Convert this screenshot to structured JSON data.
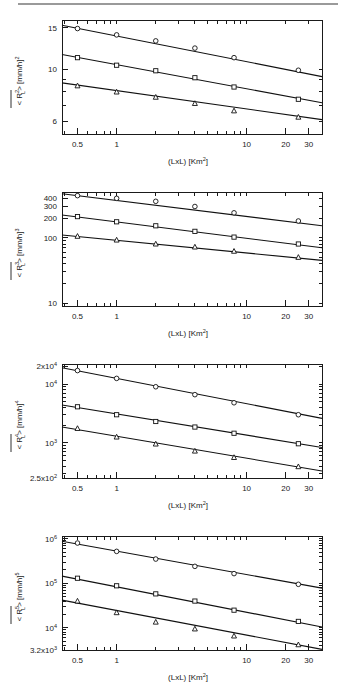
{
  "figure": {
    "name": "rainfall-moment-scaling-figure",
    "panel_count": 4,
    "background": "#ffffff",
    "line_color": "#111111",
    "marker_fill": "#ffffff"
  },
  "chart_data": [
    {
      "type": "scatter",
      "panel_id": "panel-1",
      "title": "",
      "xlabel_parts": {
        "main": "(LxL)  [Km",
        "sup": "2",
        "tail": "]"
      },
      "xlabel": "(LxL) [Km2]",
      "ylabel_parts": {
        "pre": "< R",
        "sup": "2",
        "sub": "L",
        "post": "> [mm/h]",
        "post_sup": "2"
      },
      "ylabel": "<R2L> [mm/h]2",
      "xscale": "log",
      "yscale": "log",
      "xlim": [
        0.38,
        38
      ],
      "ylim": [
        5.3,
        16.2
      ],
      "grid": false,
      "legend": "none",
      "xticks": [
        {
          "value": 0.5,
          "label": "0.5"
        },
        {
          "value": 1,
          "label": "1"
        },
        {
          "value": 10,
          "label": "10"
        },
        {
          "value": 20,
          "label": "20"
        },
        {
          "value": 30,
          "label": "30"
        }
      ],
      "yticks": [
        {
          "value": 15,
          "label": "15"
        },
        {
          "value": 10,
          "label": "10"
        },
        {
          "value": 6,
          "label": "6"
        }
      ],
      "x": [
        0.5,
        1,
        2,
        4,
        8,
        25
      ],
      "series": [
        {
          "name": "series-circle",
          "marker": "circle",
          "values": [
            14.9,
            14.0,
            13.2,
            12.3,
            11.2,
            9.9
          ],
          "fit_endpoints": {
            "x": [
              0.38,
              38
            ],
            "y": [
              15.4,
              9.3
            ]
          }
        },
        {
          "name": "series-square",
          "marker": "square",
          "values": [
            11.2,
            10.4,
            9.85,
            9.2,
            8.4,
            7.45
          ],
          "fit_endpoints": {
            "x": [
              0.38,
              38
            ],
            "y": [
              11.55,
              7.2
            ]
          }
        },
        {
          "name": "series-triangle",
          "marker": "triangle",
          "values": [
            8.5,
            8.0,
            7.6,
            7.15,
            6.65,
            6.25
          ],
          "fit_endpoints": {
            "x": [
              0.38,
              38
            ],
            "y": [
              8.75,
              6.1
            ]
          }
        }
      ]
    },
    {
      "type": "scatter",
      "panel_id": "panel-2",
      "title": "",
      "xlabel_parts": {
        "main": "(LxL)  [Km",
        "sup": "2",
        "tail": "]"
      },
      "xlabel": "(LxL) [Km2]",
      "ylabel_parts": {
        "pre": "< R",
        "sup": "3",
        "sub": "L",
        "post": "> [mm/h]",
        "post_sup": "3"
      },
      "ylabel": "<R3L> [mm/h]3",
      "xscale": "log",
      "yscale": "log",
      "xlim": [
        0.38,
        38
      ],
      "ylim": [
        9,
        500
      ],
      "grid": false,
      "legend": "none",
      "xticks": [
        {
          "value": 0.5,
          "label": "0.5"
        },
        {
          "value": 1,
          "label": "1"
        },
        {
          "value": 10,
          "label": "10"
        },
        {
          "value": 20,
          "label": "20"
        },
        {
          "value": 30,
          "label": "30"
        }
      ],
      "yticks": [
        {
          "value": 400,
          "label": "400"
        },
        {
          "value": 300,
          "label": "300"
        },
        {
          "value": 200,
          "label": "200"
        },
        {
          "value": 100,
          "label": "100"
        },
        {
          "value": 10,
          "label": "10"
        }
      ],
      "x": [
        0.5,
        1,
        2,
        4,
        8,
        25
      ],
      "series": [
        {
          "name": "series-circle",
          "marker": "circle",
          "values": [
            440,
            400,
            360,
            300,
            240,
            180
          ],
          "fit_endpoints": {
            "x": [
              0.38,
              38
            ],
            "y": [
              470,
              152
            ]
          }
        },
        {
          "name": "series-square",
          "marker": "square",
          "values": [
            210,
            175,
            152,
            125,
            102,
            80
          ],
          "fit_endpoints": {
            "x": [
              0.38,
              38
            ],
            "y": [
              222,
              70
            ]
          }
        },
        {
          "name": "series-triangle",
          "marker": "triangle",
          "values": [
            105,
            92,
            80,
            72,
            62,
            50
          ],
          "fit_endpoints": {
            "x": [
              0.38,
              38
            ],
            "y": [
              110,
              45
            ]
          }
        }
      ]
    },
    {
      "type": "scatter",
      "panel_id": "panel-3",
      "title": "",
      "xlabel_parts": {
        "main": "(LxL)  [Km",
        "sup": "2",
        "tail": "]"
      },
      "xlabel": "(LxL) [Km2]",
      "ylabel_parts": {
        "pre": "< R",
        "sup": "4",
        "sub": "L",
        "post": "> [mm/h]",
        "post_sup": "4"
      },
      "ylabel": "<R4L> [mm/h]4",
      "xscale": "log",
      "yscale": "log",
      "xlim": [
        0.38,
        38
      ],
      "ylim": [
        250,
        22000
      ],
      "grid": false,
      "legend": "none",
      "xticks": [
        {
          "value": 0.5,
          "label": "0.5"
        },
        {
          "value": 1,
          "label": "1"
        },
        {
          "value": 10,
          "label": "10"
        },
        {
          "value": 20,
          "label": "20"
        },
        {
          "value": 30,
          "label": "30"
        }
      ],
      "yticks": [
        {
          "value": 20000,
          "base": "2x10",
          "exp": "4",
          "label": "2x10^4"
        },
        {
          "value": 10000,
          "base": "10",
          "exp": "4",
          "label": "10^4"
        },
        {
          "value": 1000,
          "base": "10",
          "exp": "3",
          "label": "10^3"
        },
        {
          "value": 250,
          "base": "2.5x10",
          "exp": "2",
          "label": "2.5x10^2"
        }
      ],
      "x": [
        0.5,
        1,
        2,
        4,
        8,
        25
      ],
      "series": [
        {
          "name": "series-circle",
          "marker": "circle",
          "values": [
            17000,
            12500,
            9000,
            6600,
            4800,
            3000
          ],
          "fit_endpoints": {
            "x": [
              0.38,
              38
            ],
            "y": [
              19000,
              2600
            ]
          }
        },
        {
          "name": "series-square",
          "marker": "square",
          "values": [
            4100,
            3000,
            2300,
            1850,
            1450,
            960
          ],
          "fit_endpoints": {
            "x": [
              0.38,
              38
            ],
            "y": [
              4400,
              830
            ]
          }
        },
        {
          "name": "series-triangle",
          "marker": "triangle",
          "values": [
            1750,
            1250,
            950,
            720,
            560,
            390
          ],
          "fit_endpoints": {
            "x": [
              0.38,
              38
            ],
            "y": [
              1850,
              330
            ]
          }
        }
      ]
    },
    {
      "type": "scatter",
      "panel_id": "panel-4",
      "title": "",
      "xlabel_parts": {
        "main": "(LxL)  [Km",
        "sup": "2",
        "tail": "]"
      },
      "xlabel": "(LxL) [Km2]",
      "ylabel_parts": {
        "pre": "< R",
        "sup": "5",
        "sub": "L",
        "post": "> [mm/h]",
        "post_sup": "5"
      },
      "ylabel": "<R5L> [mm/h]5",
      "xscale": "log",
      "yscale": "log",
      "xlim": [
        0.38,
        38
      ],
      "ylim": [
        3200,
        1150000
      ],
      "grid": false,
      "legend": "none",
      "xticks": [
        {
          "value": 0.5,
          "label": "0.5"
        },
        {
          "value": 1,
          "label": "1"
        },
        {
          "value": 10,
          "label": "10"
        },
        {
          "value": 20,
          "label": "20"
        },
        {
          "value": 30,
          "label": "30"
        }
      ],
      "yticks": [
        {
          "value": 1000000,
          "base": "10",
          "exp": "6",
          "label": "10^6"
        },
        {
          "value": 100000,
          "base": "10",
          "exp": "5",
          "label": "10^5"
        },
        {
          "value": 10000,
          "base": "10",
          "exp": "4",
          "label": "10^4"
        },
        {
          "value": 3200,
          "base": "3.2x10",
          "exp": "3",
          "label": "3.2x10^3"
        }
      ],
      "x": [
        0.5,
        1,
        2,
        4,
        8,
        25
      ],
      "series": [
        {
          "name": "series-circle",
          "marker": "circle",
          "values": [
            800000,
            520000,
            350000,
            240000,
            165000,
            95000
          ],
          "fit_endpoints": {
            "x": [
              0.38,
              38
            ],
            "y": [
              880000,
              78000
            ]
          }
        },
        {
          "name": "series-square",
          "marker": "square",
          "values": [
            130000,
            88000,
            58000,
            40000,
            25000,
            14000
          ],
          "fit_endpoints": {
            "x": [
              0.38,
              38
            ],
            "y": [
              145000,
              10500
            ]
          }
        },
        {
          "name": "series-triangle",
          "marker": "triangle",
          "values": [
            40000,
            22000,
            13500,
            9500,
            6600,
            4200
          ],
          "fit_endpoints": {
            "x": [
              0.38,
              38
            ],
            "y": [
              42000,
              3300
            ]
          }
        }
      ]
    }
  ]
}
